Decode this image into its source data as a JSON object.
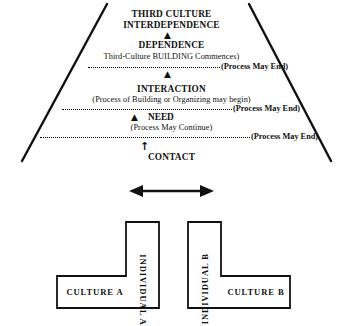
{
  "diagram": {
    "stroke_color": "#111111"
  },
  "pyramid": {
    "stages": [
      {
        "id": "interdependence",
        "heading_line1": "THIRD CULTURE",
        "heading_line2": "INTERDEPENDENCE"
      },
      {
        "id": "dependence",
        "heading": "DEPENDENCE",
        "note": "Third-Culture BUILDING Commences)"
      },
      {
        "id": "interaction",
        "heading": "INTERACTION",
        "note": "(Process of Building or Organizing may begin)"
      },
      {
        "id": "need",
        "heading": "NEED",
        "note": "(Process May Continue)"
      },
      {
        "id": "contact",
        "heading": "CONTACT"
      }
    ],
    "exit_label": "(Process May End)",
    "exit_labels": [
      "(Process May End)",
      "(Process May End)",
      "(Process May End)"
    ],
    "arrow_glyph": "▲",
    "contact_arrow_glyph": "↑"
  },
  "cultures": {
    "link_arrow": "double-headed-arrow",
    "left": {
      "culture_label": "CULTURE  A",
      "individual_label": "INDIVIDUAL  A"
    },
    "right": {
      "culture_label": "CULTURE  B",
      "individual_label": "INDIVIDUAL  B"
    }
  }
}
